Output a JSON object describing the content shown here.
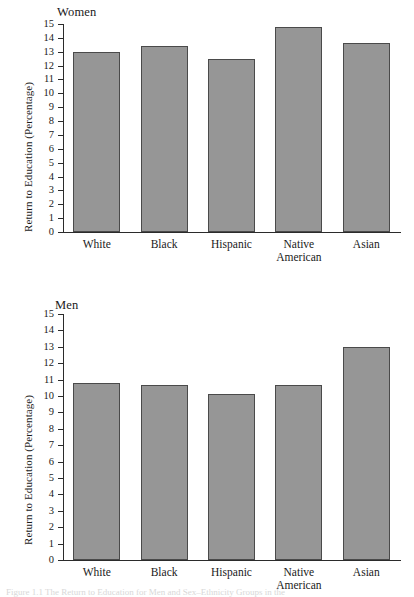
{
  "chart_data": [
    {
      "type": "bar",
      "title": "Women",
      "xlabel": "",
      "ylabel": "Return to Education (Percentage)",
      "categories": [
        "White",
        "Black",
        "Hispanic",
        "Native\nAmerican",
        "Asian"
      ],
      "values": [
        13.0,
        13.4,
        12.5,
        14.8,
        13.6
      ],
      "ylim": [
        0,
        15
      ],
      "yticks": [
        15,
        14,
        13,
        12,
        11,
        10,
        9,
        8,
        7,
        6,
        5,
        4,
        3,
        2,
        1,
        0
      ],
      "grid": false,
      "legend": "none",
      "bar_color": "#969696",
      "bar_edge_color": "#4a4a4a"
    },
    {
      "type": "bar",
      "title": "Men",
      "xlabel": "",
      "ylabel": "Return to Education (Percentage)",
      "categories": [
        "White",
        "Black",
        "Hispanic",
        "Native\nAmerican",
        "Asian"
      ],
      "values": [
        10.8,
        10.65,
        10.1,
        10.7,
        13.0
      ],
      "ylim": [
        0,
        15
      ],
      "yticks": [
        15,
        14,
        13,
        12,
        11,
        10,
        9,
        8,
        7,
        6,
        5,
        4,
        3,
        2,
        1,
        0
      ],
      "grid": false,
      "legend": "none",
      "bar_color": "#969696",
      "bar_edge_color": "#4a4a4a"
    }
  ],
  "figure": {
    "caption_fragment": "Figure 1.1  The Return to Education for Men and Sex–Ethnicity Groups in the"
  }
}
